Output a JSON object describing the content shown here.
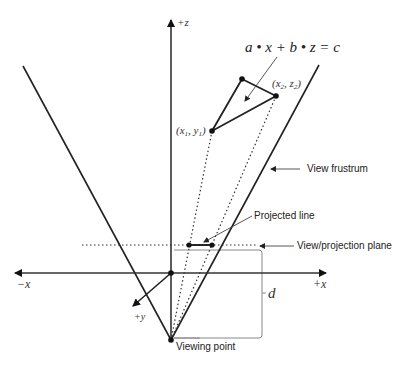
{
  "diagram": {
    "axes": {
      "z_label": "+z",
      "x_pos_label": "+x",
      "x_neg_label": "−x",
      "y_label": "+y"
    },
    "equation": "a • x + b • z = c",
    "points": {
      "p1_label": "(x₁, y₁)",
      "p1_main": "x",
      "p1_sub1": "1",
      "p1_mid": ", y",
      "p1_sub2": "1",
      "p2_main": "x",
      "p2_sub1": "2",
      "p2_mid": ", z",
      "p2_sub2": "2"
    },
    "callouts": {
      "view_frustum": "View frustrum",
      "projected_line": "Projected line",
      "projection_plane": "View/projection plane",
      "viewing_point": "Viewing point",
      "distance": "d"
    },
    "colors": {
      "line": "#222222",
      "bracket": "#777777",
      "caption": "#cccccc"
    }
  }
}
